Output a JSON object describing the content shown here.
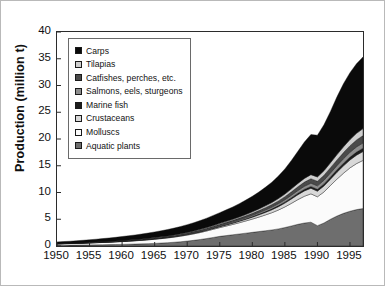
{
  "figure": {
    "background": "#ffffff",
    "border_color": "#b9b9b9"
  },
  "chart_data": {
    "type": "area",
    "stacked": true,
    "title": "",
    "xlabel": "",
    "ylabel": "Production (million t)",
    "xlim": [
      1950,
      1997
    ],
    "ylim": [
      0,
      40
    ],
    "ytick_labels": [
      "0",
      "5",
      "10",
      "15",
      "20",
      "25",
      "30",
      "35",
      "40"
    ],
    "ytick_values": [
      0,
      5,
      10,
      15,
      20,
      25,
      30,
      35,
      40
    ],
    "xtick_labels": [
      "1950",
      "1955",
      "1960",
      "1965",
      "1970",
      "1975",
      "1980",
      "1985",
      "1990",
      "1995"
    ],
    "xtick_values": [
      1950,
      1955,
      1960,
      1965,
      1970,
      1975,
      1980,
      1985,
      1990,
      1995
    ],
    "grid": false,
    "legend_position": "upper-left-inside",
    "x": [
      1950,
      1951,
      1952,
      1953,
      1954,
      1955,
      1956,
      1957,
      1958,
      1959,
      1960,
      1961,
      1962,
      1963,
      1964,
      1965,
      1966,
      1967,
      1968,
      1969,
      1970,
      1971,
      1972,
      1973,
      1974,
      1975,
      1976,
      1977,
      1978,
      1979,
      1980,
      1981,
      1982,
      1983,
      1984,
      1985,
      1986,
      1987,
      1988,
      1989,
      1990,
      1991,
      1992,
      1993,
      1994,
      1995,
      1996,
      1997
    ],
    "stack_order_bottom_to_top": [
      "Aquatic plants",
      "Molluscs",
      "Crustaceans",
      "Marine fish",
      "Salmons, eels, sturgeons",
      "Catfishes, perches, etc.",
      "Tilapias",
      "Carps"
    ],
    "series": [
      {
        "name": "Carps",
        "color": "#0a0a0a",
        "values": [
          0.3,
          0.33,
          0.36,
          0.4,
          0.44,
          0.48,
          0.53,
          0.58,
          0.63,
          0.68,
          0.74,
          0.8,
          0.86,
          0.92,
          0.99,
          1.06,
          1.13,
          1.21,
          1.29,
          1.37,
          1.46,
          1.55,
          1.65,
          1.76,
          1.88,
          2.0,
          2.15,
          2.3,
          2.48,
          2.68,
          2.9,
          3.15,
          3.45,
          3.8,
          4.2,
          4.7,
          5.3,
          6.0,
          6.8,
          7.5,
          7.8,
          8.6,
          9.6,
          10.8,
          11.8,
          12.5,
          13.0,
          13.4
        ]
      },
      {
        "name": "Tilapias",
        "color": "#cfcfcf",
        "values": [
          0.01,
          0.01,
          0.01,
          0.01,
          0.02,
          0.02,
          0.02,
          0.02,
          0.03,
          0.03,
          0.03,
          0.04,
          0.04,
          0.05,
          0.05,
          0.06,
          0.06,
          0.07,
          0.08,
          0.09,
          0.1,
          0.11,
          0.12,
          0.13,
          0.15,
          0.16,
          0.18,
          0.2,
          0.22,
          0.25,
          0.28,
          0.31,
          0.35,
          0.39,
          0.44,
          0.5,
          0.56,
          0.63,
          0.7,
          0.76,
          0.8,
          0.86,
          0.92,
          1.0,
          1.08,
          1.16,
          1.24,
          1.3
        ]
      },
      {
        "name": "Catfishes, perches, etc.",
        "color": "#4a4a4a",
        "values": [
          0.03,
          0.03,
          0.03,
          0.04,
          0.04,
          0.04,
          0.05,
          0.05,
          0.06,
          0.06,
          0.07,
          0.07,
          0.08,
          0.09,
          0.09,
          0.1,
          0.11,
          0.12,
          0.13,
          0.14,
          0.15,
          0.16,
          0.18,
          0.19,
          0.21,
          0.23,
          0.25,
          0.27,
          0.3,
          0.33,
          0.36,
          0.39,
          0.43,
          0.47,
          0.52,
          0.57,
          0.63,
          0.7,
          0.77,
          0.83,
          0.86,
          0.92,
          0.99,
          1.06,
          1.14,
          1.22,
          1.3,
          1.36
        ]
      },
      {
        "name": "Salmons, eels, sturgeons",
        "color": "#8d8d8d",
        "values": [
          0.01,
          0.01,
          0.01,
          0.02,
          0.02,
          0.02,
          0.02,
          0.03,
          0.03,
          0.03,
          0.04,
          0.04,
          0.04,
          0.05,
          0.05,
          0.06,
          0.06,
          0.07,
          0.07,
          0.08,
          0.09,
          0.1,
          0.11,
          0.12,
          0.13,
          0.14,
          0.16,
          0.17,
          0.19,
          0.21,
          0.23,
          0.26,
          0.29,
          0.32,
          0.36,
          0.4,
          0.45,
          0.5,
          0.56,
          0.61,
          0.64,
          0.68,
          0.73,
          0.78,
          0.84,
          0.9,
          0.96,
          1.0
        ]
      },
      {
        "name": "Marine fish",
        "color": "#1c1c1c",
        "values": [
          0.01,
          0.01,
          0.01,
          0.01,
          0.01,
          0.02,
          0.02,
          0.02,
          0.02,
          0.02,
          0.03,
          0.03,
          0.03,
          0.03,
          0.04,
          0.04,
          0.04,
          0.05,
          0.05,
          0.05,
          0.06,
          0.06,
          0.07,
          0.07,
          0.08,
          0.09,
          0.09,
          0.1,
          0.11,
          0.12,
          0.13,
          0.15,
          0.16,
          0.18,
          0.2,
          0.22,
          0.25,
          0.28,
          0.31,
          0.34,
          0.36,
          0.39,
          0.42,
          0.46,
          0.5,
          0.54,
          0.58,
          0.62
        ]
      },
      {
        "name": "Crustaceans",
        "color": "#d8d8d8",
        "values": [
          0.01,
          0.01,
          0.01,
          0.01,
          0.01,
          0.02,
          0.02,
          0.02,
          0.02,
          0.03,
          0.03,
          0.03,
          0.04,
          0.04,
          0.05,
          0.05,
          0.06,
          0.06,
          0.07,
          0.08,
          0.09,
          0.1,
          0.11,
          0.13,
          0.15,
          0.17,
          0.2,
          0.23,
          0.27,
          0.31,
          0.36,
          0.42,
          0.48,
          0.55,
          0.63,
          0.72,
          0.82,
          0.92,
          1.0,
          1.05,
          1.05,
          1.12,
          1.2,
          1.28,
          1.38,
          1.48,
          1.58,
          1.66
        ]
      },
      {
        "name": "Molluscs",
        "color": "#fbfbfb",
        "values": [
          0.25,
          0.27,
          0.29,
          0.31,
          0.34,
          0.36,
          0.39,
          0.42,
          0.45,
          0.49,
          0.53,
          0.57,
          0.61,
          0.66,
          0.71,
          0.77,
          0.83,
          0.89,
          0.96,
          1.04,
          1.12,
          1.21,
          1.3,
          1.41,
          1.52,
          1.64,
          1.78,
          1.93,
          2.1,
          2.28,
          2.48,
          2.7,
          2.95,
          3.22,
          3.52,
          3.85,
          4.22,
          4.62,
          5.0,
          5.3,
          5.4,
          5.8,
          6.3,
          6.9,
          7.5,
          8.1,
          8.6,
          9.0
        ]
      },
      {
        "name": "Aquatic plants",
        "color": "#6e6e6e",
        "values": [
          0.15,
          0.16,
          0.17,
          0.18,
          0.19,
          0.21,
          0.22,
          0.24,
          0.26,
          0.28,
          0.3,
          0.33,
          0.36,
          0.4,
          0.44,
          0.49,
          0.55,
          0.62,
          0.7,
          0.8,
          0.92,
          1.06,
          1.22,
          1.4,
          1.6,
          1.8,
          1.95,
          2.1,
          2.25,
          2.4,
          2.55,
          2.7,
          2.85,
          3.0,
          3.2,
          3.45,
          3.75,
          4.05,
          4.3,
          4.45,
          3.8,
          4.3,
          5.0,
          5.6,
          6.1,
          6.5,
          6.8,
          7.0
        ]
      }
    ]
  },
  "legend": {
    "items": [
      {
        "label": "Carps",
        "color": "#0a0a0a"
      },
      {
        "label": "Tilapias",
        "color": "#cfcfcf"
      },
      {
        "label": "Catfishes, perches, etc.",
        "color": "#4a4a4a"
      },
      {
        "label": "Salmons, eels, sturgeons",
        "color": "#8d8d8d"
      },
      {
        "label": "Marine fish",
        "color": "#1c1c1c"
      },
      {
        "label": "Crustaceans",
        "color": "#d8d8d8"
      },
      {
        "label": "Molluscs",
        "color": "#fbfbfb"
      },
      {
        "label": "Aquatic plants",
        "color": "#6e6e6e"
      }
    ]
  }
}
